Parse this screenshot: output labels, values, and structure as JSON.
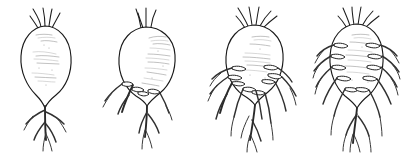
{
  "figure": {
    "title": "Progressive root nodulation series on taproots",
    "caption": "",
    "medium": "ink line drawing",
    "background_color": "#ffffff",
    "ink_color": "#1a1a1a",
    "root_ink_color": "#2a2a2a",
    "shading_color": "#9a9a9a",
    "canvas": {
      "width": 411,
      "height": 157
    },
    "panel_count": 4,
    "panels": [
      {
        "index": 1,
        "label": "stage-1",
        "description": "Smooth elongated taproot, no nodules, simple forked root tip",
        "nodule_count": 0,
        "nodules_left": 0,
        "nodules_right": 0,
        "stalk_count": 4,
        "body_shape": "elongated conical",
        "lateral_root_count": 4,
        "center_x": 47,
        "body_top_y": 25,
        "body_bottom_y": 100
      },
      {
        "index": 2,
        "label": "stage-2",
        "description": "Ovoid taproot with a few basal nodules and short lateral roots",
        "nodule_count": 4,
        "nodules_left": 2,
        "nodules_right": 2,
        "stalk_count": 3,
        "body_shape": "broad ovoid",
        "lateral_root_count": 6,
        "center_x": 148,
        "body_top_y": 26,
        "body_bottom_y": 98
      },
      {
        "index": 3,
        "label": "stage-3",
        "description": "Ovoid taproot with numerous nodules clustered on lower half and a spreading root system",
        "nodule_count": 8,
        "nodules_left": 4,
        "nodules_right": 4,
        "stalk_count": 5,
        "body_shape": "broad ovoid",
        "lateral_root_count": 10,
        "center_x": 256,
        "body_top_y": 24,
        "body_bottom_y": 99
      },
      {
        "index": 4,
        "label": "stage-4",
        "description": "Ovoid taproot densely nodulated along both flanks with an extensive branching root system",
        "nodule_count": 10,
        "nodules_left": 5,
        "nodules_right": 5,
        "stalk_count": 6,
        "body_shape": "narrow ovoid",
        "lateral_root_count": 12,
        "center_x": 358,
        "body_top_y": 24,
        "body_bottom_y": 100
      }
    ]
  }
}
